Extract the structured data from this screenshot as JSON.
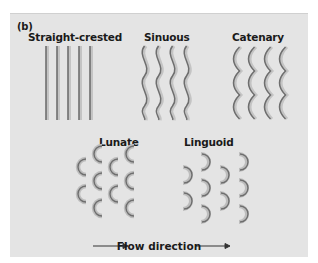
{
  "figure": {
    "panel_label": "(b)",
    "background_color": "#e4e4e4",
    "stroke_color": "#6e6e6e",
    "shadow_color": "#b8b8b8",
    "ripple_types": [
      {
        "name": "Straight-crested",
        "shape": "straight-lines",
        "count": 5
      },
      {
        "name": "Sinuous",
        "shape": "wavy-lines",
        "count": 4
      },
      {
        "name": "Catenary",
        "shape": "chained-arcs",
        "count": 4
      },
      {
        "name": "Lunate",
        "shape": "crescents-concave-downstream",
        "count": 10
      },
      {
        "name": "Linguoid",
        "shape": "crescents-convex-downstream",
        "count": 12
      }
    ],
    "flow_label": "Flow direction",
    "flow_arrow": "right"
  }
}
